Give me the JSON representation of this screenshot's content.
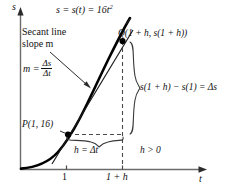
{
  "figure": {
    "kind": "calculus-secant-line-diagram",
    "axes": {
      "vertical_axis_label": "s",
      "horizontal_axis_label": "t",
      "tick_labels": [
        "1",
        "1 + h"
      ]
    },
    "curve": {
      "equation_label": "s = s(t) = 16t",
      "equation_exponent": "2",
      "color": "#000000"
    },
    "annotations": {
      "secant_line_label_line1": "Secant line",
      "secant_line_label_line2": "slope m",
      "slope_formula_lhs": "m =",
      "slope_formula_numerator": "Δs",
      "slope_formula_denominator": "Δt",
      "point_q_label": "Q(1 + h, s(1 + h))",
      "point_p_label": "P(1, 16)",
      "delta_s_label": "s(1 + h) − s(1) = Δs",
      "delta_t_label": "h = Δt",
      "h_condition_label": "h > 0"
    },
    "colors": {
      "ink": "#111111",
      "axis": "#555555",
      "dashed": "#555555",
      "curve": "#000000",
      "secant": "#222222"
    }
  }
}
